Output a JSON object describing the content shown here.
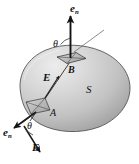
{
  "figure": {
    "background_color": "#ffffff",
    "surface": {
      "name": "S",
      "label": "S",
      "fill_light": "#e2e2e2",
      "fill_mid": "#c9c9c9",
      "fill_dark": "#9a9a9a",
      "outline_color": "#4a4a4a",
      "label_position": {
        "x": 86,
        "y": 86
      }
    },
    "patches": [
      {
        "id": "A",
        "label": "A",
        "label_position": {
          "x": 50,
          "y": 110
        },
        "description": "small area element on left side of surface",
        "normal_vector": {
          "label": "e",
          "subscript": "n",
          "label_position": {
            "x": 3,
            "y": 127
          },
          "direction": "down-left-outward"
        },
        "field_vector": {
          "label": "E",
          "label_position": {
            "x": 32,
            "y": 143
          },
          "direction": "down-right"
        },
        "angle": {
          "label": "θ",
          "label_position": {
            "x": 27,
            "y": 122
          }
        }
      },
      {
        "id": "B",
        "label": "B",
        "label_position": {
          "x": 68,
          "y": 66
        },
        "description": "small area element on top of surface",
        "normal_vector": {
          "label": "e",
          "subscript": "n",
          "label_position": {
            "x": 70,
            "y": 3
          },
          "direction": "up-vertical-outward"
        },
        "field_vector": {
          "label": "E",
          "label_position": {
            "x": 44,
            "y": 73
          },
          "direction": "up-right"
        },
        "angle": {
          "label": "θ",
          "label_position": {
            "x": 53,
            "y": 39
          }
        }
      }
    ],
    "field_line": {
      "description": "straight electric field line entering at A and exiting at B",
      "color": "#333333"
    },
    "exit_ray": {
      "description": "thin line continuing up-right beyond patch B",
      "color": "#555555"
    }
  }
}
